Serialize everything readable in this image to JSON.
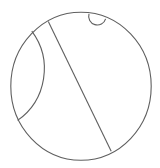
{
  "figure": {
    "title": "Circle with chord, inner arc and small semicircle",
    "stroke_color": "#5f5f5f",
    "background": "#ffffff",
    "outer_circle": {
      "cx": 81,
      "cy": 86.3,
      "rx": 70.2,
      "ry": 74
    },
    "chord": {
      "x1": 48.3,
      "y1": 21.6,
      "x2": 111.2,
      "y2": 151.2
    },
    "inner_arc": {
      "start": [
        31.8,
        31.2
      ],
      "end": [
        17.6,
        120.4
      ],
      "radius": 63,
      "bulge": "right"
    },
    "small_semicircle": {
      "start": [
        89,
        13.9
      ],
      "end": [
        105.6,
        18.8
      ],
      "radius": 8.6,
      "bulge": "down"
    }
  }
}
